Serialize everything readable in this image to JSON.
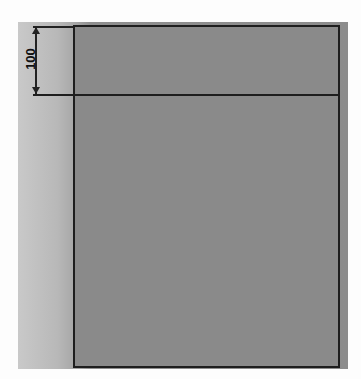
{
  "diagram": {
    "type": "dimensioned-rectangle",
    "dimension": {
      "label": "100",
      "orientation": "vertical",
      "applies_to": "top-band-height"
    },
    "colors": {
      "fill": "#8a8a8a",
      "stroke": "#1e1e1e",
      "side_strip": "#b8b8b8"
    }
  }
}
